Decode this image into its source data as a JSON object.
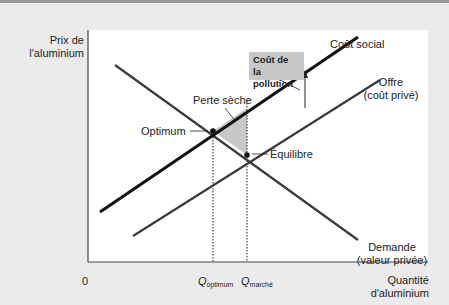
{
  "axes": {
    "y_label_line1": "Prix de",
    "y_label_line2": "l'aluminium",
    "x_label_line1": "Quantité",
    "x_label_line2": "d'aluminium",
    "origin": "0"
  },
  "curves": {
    "social_cost": "Coût social",
    "supply_line1": "Offre",
    "supply_line2": "(coût privé)",
    "demand_line1": "Demande",
    "demand_line2": "(valeur privée)"
  },
  "annotations": {
    "pollution_cost_line1": "Coût de",
    "pollution_cost_line2": "la pollution",
    "deadweight_loss": "Perte sèche",
    "optimum": "Optimum",
    "equilibrium": "Équilibre"
  },
  "ticks": {
    "q_optimum_main": "Q",
    "q_optimum_sub": "optimum",
    "q_market_main": "Q",
    "q_market_sub": "marché"
  },
  "colors": {
    "background": "#ebebeb",
    "plot": "#ffffff",
    "social_cost": "#111111",
    "supply": "#3a3a3a",
    "demand": "#3a3a3a",
    "shaded": "#c8c8c8"
  }
}
